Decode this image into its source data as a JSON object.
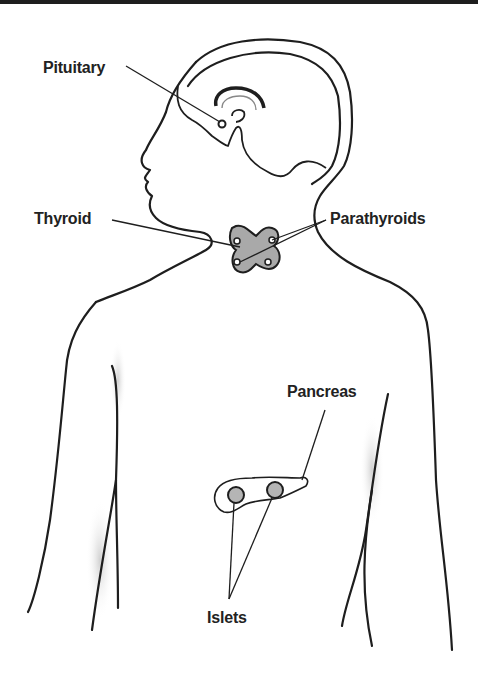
{
  "diagram": {
    "type": "anatomical-illustration",
    "colors": {
      "line": "#1e1e1e",
      "gland_fill": "#a9a9a9",
      "shadow": "#c8c8c8",
      "background": "#ffffff"
    },
    "labels": {
      "pituitary": "Pituitary",
      "thyroid": "Thyroid",
      "parathyroids": "Parathyroids",
      "pancreas": "Pancreas",
      "islets": "Islets"
    },
    "callouts": [
      {
        "label": "Pituitary",
        "target": "pituitary gland at base of brain"
      },
      {
        "label": "Thyroid",
        "target": "thyroid gland in neck"
      },
      {
        "label": "Parathyroids",
        "target": "two parathyroid glands on thyroid",
        "lines": 2
      },
      {
        "label": "Pancreas",
        "target": "pancreas in abdomen"
      },
      {
        "label": "Islets",
        "target": "two islet clusters in pancreas",
        "lines": 2
      }
    ]
  }
}
